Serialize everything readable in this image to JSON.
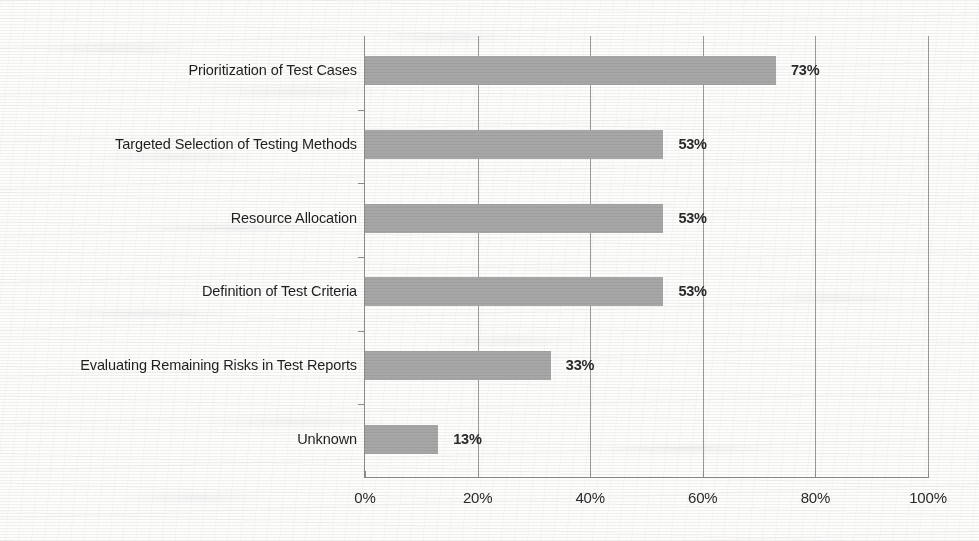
{
  "chart_data": {
    "type": "bar",
    "orientation": "horizontal",
    "title": "",
    "xlabel": "",
    "ylabel": "",
    "categories": [
      "Prioritization of Test Cases",
      "Targeted Selection of Testing Methods",
      "Resource Allocation",
      "Definition of Test Criteria",
      "Evaluating Remaining Risks in Test Reports",
      "Unknown"
    ],
    "values": [
      73,
      53,
      53,
      53,
      33,
      13
    ],
    "value_labels": [
      "73%",
      "53%",
      "53%",
      "53%",
      "33%",
      "13%"
    ],
    "xlim": [
      0,
      100
    ],
    "xticks": [
      0,
      20,
      40,
      60,
      80,
      100
    ],
    "xtick_labels": [
      "0%",
      "20%",
      "40%",
      "60%",
      "80%",
      "100%"
    ],
    "grid": "vertical-only",
    "legend": "none",
    "bar_color": "#a7a7a7",
    "axis_color": "#8d8d8d",
    "gridline_color": "#9a9a9a",
    "label_color": "#1f1f1f",
    "value_label_color": "#2b2b2b",
    "background_color": "#fdfdfc"
  }
}
